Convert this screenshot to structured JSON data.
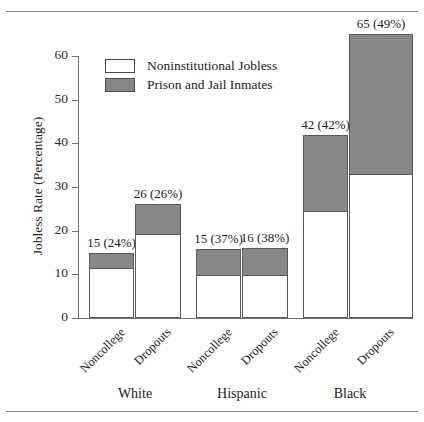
{
  "figure": {
    "top_rule": true,
    "bottom_rule": true,
    "caption_fragment": ""
  },
  "legend": {
    "position": "inside-top-left",
    "items": [
      {
        "label": "Noninstitutional Jobless",
        "swatch": "white",
        "color": "#ffffff"
      },
      {
        "label": "Prison and Jail Inmates",
        "swatch": "gray",
        "color": "#878787"
      }
    ]
  },
  "axis": {
    "y_title": "Jobless Rate (Percentage)",
    "y_ticks": [
      "0",
      "10",
      "20",
      "30",
      "40",
      "50",
      "60"
    ],
    "y_min": 0,
    "y_max": 60
  },
  "groups": [
    {
      "label": "White"
    },
    {
      "label": "Hispanic"
    },
    {
      "label": "Black"
    }
  ],
  "categories": [
    "Noncollege",
    "Dropouts",
    "Noncollege",
    "Dropouts",
    "Noncollege",
    "Dropouts"
  ],
  "bar_labels": [
    "15 (24%)",
    "26 (26%)",
    "15 (37%)",
    "16 (38%)",
    "42 (42%)",
    "65 (49%)"
  ],
  "chart_data": {
    "type": "bar",
    "subtype": "stacked-bar",
    "title": "",
    "xlabel": "",
    "ylabel": "Jobless Rate (Percentage)",
    "ylim": [
      0,
      60
    ],
    "yticks": [
      0,
      10,
      20,
      30,
      40,
      50,
      60
    ],
    "grid": false,
    "legend_position": "upper left inside",
    "group_labels": [
      "White",
      "Hispanic",
      "Black"
    ],
    "categories": [
      "White Noncollege",
      "White Dropouts",
      "Hispanic Noncollege",
      "Hispanic Dropouts",
      "Black Noncollege",
      "Black Dropouts"
    ],
    "series": [
      {
        "name": "Noninstitutional Jobless",
        "color": "#ffffff",
        "values": [
          11.4,
          19.2,
          9.8,
          9.9,
          24.4,
          33.0
        ]
      },
      {
        "name": "Prison and Jail Inmates",
        "color": "#878787",
        "values": [
          3.6,
          6.8,
          6.0,
          6.1,
          17.6,
          32.0
        ]
      }
    ],
    "totals": [
      15,
      26,
      15.8,
      16,
      42,
      65
    ],
    "annotations": [
      {
        "category": "White Noncollege",
        "text": "15 (24%)",
        "total": 15,
        "inmate_share_pct": 24
      },
      {
        "category": "White Dropouts",
        "text": "26 (26%)",
        "total": 26,
        "inmate_share_pct": 26
      },
      {
        "category": "Hispanic Noncollege",
        "text": "15 (37%)",
        "total": 15,
        "inmate_share_pct": 37
      },
      {
        "category": "Hispanic Dropouts",
        "text": "16 (38%)",
        "total": 16,
        "inmate_share_pct": 38
      },
      {
        "category": "Black Noncollege",
        "text": "42 (42%)",
        "total": 42,
        "inmate_share_pct": 42
      },
      {
        "category": "Black Dropouts",
        "text": "65 (49%)",
        "total": 65,
        "inmate_share_pct": 49
      }
    ]
  }
}
